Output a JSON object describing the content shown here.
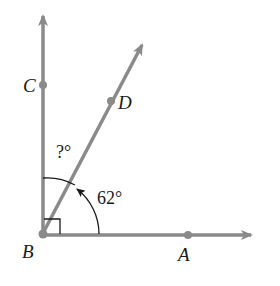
{
  "diagram": {
    "type": "geometry-angle-figure",
    "vertex": {
      "label": "B",
      "x": 42,
      "y": 235
    },
    "rays": [
      {
        "name": "BC",
        "direction_deg": 90,
        "arrow_tip": [
          43,
          14
        ]
      },
      {
        "name": "BD",
        "direction_deg": 62,
        "arrow_tip": [
          143,
          43
        ]
      },
      {
        "name": "BA",
        "direction_deg": 0,
        "arrow_tip": [
          253,
          235
        ]
      }
    ],
    "points": {
      "A": {
        "label": "A",
        "x": 188,
        "y": 235
      },
      "B": {
        "label": "B",
        "x": 42,
        "y": 235
      },
      "C": {
        "label": "C",
        "x": 43,
        "y": 85
      },
      "D": {
        "label": "D",
        "x": 111,
        "y": 101
      }
    },
    "angles": {
      "right_angle": {
        "between": [
          "BC",
          "BA"
        ],
        "measure": "90°",
        "marker": "square"
      },
      "angle_DBA": {
        "label": "62°",
        "measure": 62
      },
      "angle_CBD": {
        "label": "?°",
        "measure": "unknown"
      }
    },
    "colors": {
      "ray": "#8a8a8a",
      "point": "#8a8a8a",
      "arc": "#1a1a1a",
      "text": "#1a1a1a"
    }
  }
}
